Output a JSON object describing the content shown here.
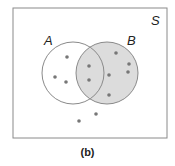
{
  "diagram": {
    "type": "venn",
    "universe_label": "S",
    "caption": "(b)",
    "shaded_region": "B",
    "colors": {
      "background": "#ffffff",
      "outline": "#8a8a8a",
      "shade": "#dcdcdc",
      "dot": "#777777",
      "text": "#222222"
    },
    "universe": {
      "x": 13,
      "y": 8,
      "width": 154,
      "height": 130
    },
    "sets": [
      {
        "label": "A",
        "cx": 73,
        "cy": 73,
        "r": 31,
        "shaded": false,
        "label_x": 44,
        "label_y": 45
      },
      {
        "label": "B",
        "cx": 107,
        "cy": 73,
        "r": 31,
        "shaded": true,
        "label_x": 127,
        "label_y": 45
      }
    ],
    "points": {
      "A_only": [
        [
          67,
          57
        ],
        [
          55,
          77
        ],
        [
          66,
          82
        ]
      ],
      "A_and_B": [
        [
          89,
          66
        ],
        [
          89,
          80
        ]
      ],
      "B_only": [
        [
          116,
          53
        ],
        [
          129,
          64
        ],
        [
          128,
          72
        ],
        [
          109,
          75
        ],
        [
          109,
          95
        ]
      ],
      "outside": [
        [
          96,
          114
        ],
        [
          79,
          121
        ]
      ]
    },
    "counts": {
      "A_only": 3,
      "A_and_B": 2,
      "B_only": 5,
      "outside": 2,
      "total": 12
    }
  }
}
